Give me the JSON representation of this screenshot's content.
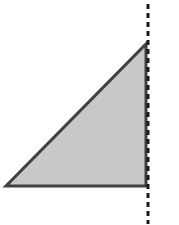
{
  "diagram": {
    "type": "geometry",
    "background": "#ffffff",
    "triangle": {
      "kind": "right-triangle",
      "points": [
        [
          6,
          186
        ],
        [
          146,
          186
        ],
        [
          146,
          44
        ]
      ],
      "fill": "#c8c8c8",
      "stroke": "#404040",
      "stroke_width": 3
    },
    "axis_line": {
      "style": "dashed",
      "x": 148,
      "y1": 4,
      "y2": 224,
      "stroke": "#1a1a1a",
      "stroke_width": 3,
      "dash": "5,4"
    }
  }
}
